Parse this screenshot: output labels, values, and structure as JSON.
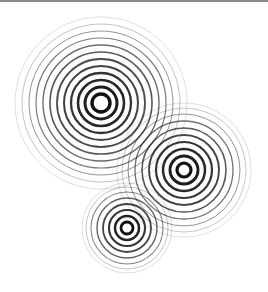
{
  "canvas": {
    "width": 268,
    "height": 292,
    "background": "#ffffff",
    "top_rule_color": "#8a8a8a"
  },
  "figures": [
    {
      "name": "ring-group-large",
      "cx": 101,
      "cy": 103,
      "rings": [
        {
          "r": 9,
          "w": 3.4,
          "o": 1.0
        },
        {
          "r": 16,
          "w": 3.0,
          "o": 0.95
        },
        {
          "r": 23,
          "w": 2.6,
          "o": 0.9
        },
        {
          "r": 30,
          "w": 2.3,
          "o": 0.85
        },
        {
          "r": 37,
          "w": 2.0,
          "o": 0.8
        },
        {
          "r": 44,
          "w": 1.8,
          "o": 0.75
        },
        {
          "r": 51,
          "w": 1.6,
          "o": 0.7
        },
        {
          "r": 58,
          "w": 1.4,
          "o": 0.62
        },
        {
          "r": 65,
          "w": 1.2,
          "o": 0.55
        },
        {
          "r": 72,
          "w": 1.0,
          "o": 0.45
        },
        {
          "r": 79,
          "w": 0.8,
          "o": 0.32
        },
        {
          "r": 86,
          "w": 0.7,
          "o": 0.2
        }
      ]
    },
    {
      "name": "ring-group-medium",
      "cx": 184,
      "cy": 170,
      "rings": [
        {
          "r": 7,
          "w": 3.2,
          "o": 1.0
        },
        {
          "r": 14,
          "w": 2.9,
          "o": 0.95
        },
        {
          "r": 21,
          "w": 2.5,
          "o": 0.9
        },
        {
          "r": 28,
          "w": 2.2,
          "o": 0.85
        },
        {
          "r": 35,
          "w": 1.9,
          "o": 0.78
        },
        {
          "r": 42,
          "w": 1.6,
          "o": 0.7
        },
        {
          "r": 49,
          "w": 1.3,
          "o": 0.6
        },
        {
          "r": 56,
          "w": 1.0,
          "o": 0.45
        },
        {
          "r": 62,
          "w": 0.8,
          "o": 0.3
        },
        {
          "r": 67,
          "w": 0.7,
          "o": 0.2
        }
      ]
    },
    {
      "name": "ring-group-small",
      "cx": 127,
      "cy": 228,
      "rings": [
        {
          "r": 6,
          "w": 2.8,
          "o": 1.0
        },
        {
          "r": 12,
          "w": 2.5,
          "o": 0.92
        },
        {
          "r": 18,
          "w": 2.1,
          "o": 0.85
        },
        {
          "r": 24,
          "w": 1.8,
          "o": 0.78
        },
        {
          "r": 30,
          "w": 1.4,
          "o": 0.65
        },
        {
          "r": 36,
          "w": 1.1,
          "o": 0.5
        },
        {
          "r": 41,
          "w": 0.8,
          "o": 0.32
        },
        {
          "r": 45,
          "w": 0.7,
          "o": 0.2
        }
      ]
    }
  ]
}
